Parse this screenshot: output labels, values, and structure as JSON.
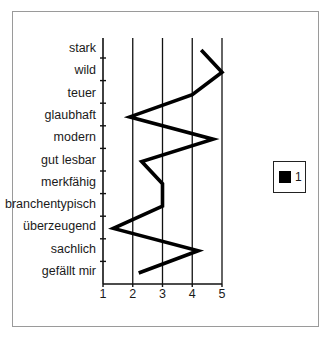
{
  "chart_data": {
    "type": "line",
    "orientation": "horizontal-profile",
    "title": "",
    "xlabel": "",
    "ylabel": "",
    "categories": [
      "stark",
      "wild",
      "teuer",
      "glaubhaft",
      "modern",
      "gut lesbar",
      "merkfähig",
      "branchentypisch",
      "überzeugend",
      "sachlich",
      "gefällt mir"
    ],
    "series": [
      {
        "name": "1",
        "color": "#000000",
        "values": [
          4.3,
          5.0,
          4.0,
          1.9,
          4.7,
          2.3,
          3.0,
          3.0,
          1.35,
          4.2,
          2.2
        ]
      }
    ],
    "x_ticks": [
      "1",
      "2",
      "3",
      "4",
      "5"
    ],
    "xlim": [
      1,
      5
    ],
    "grid": "vertical lines at 2,3,4,5",
    "legend": {
      "position": "right",
      "entries": [
        "1"
      ]
    }
  },
  "legend": {
    "label": "1"
  }
}
